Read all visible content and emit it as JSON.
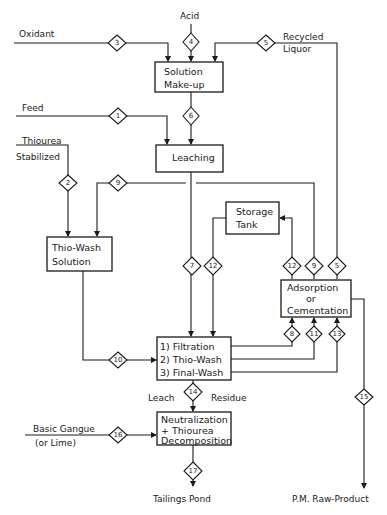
{
  "diagram": {
    "type": "process-flowsheet",
    "inputs": {
      "acid": "Acid",
      "oxidant": "Oxidant",
      "recycled_liquor_line1": "Recycled",
      "recycled_liquor_line2": "Liquor",
      "feed": "Feed",
      "thiourea_line1": "Thiourea",
      "thiourea_line2": "Stabilized",
      "basic_gangue_line1": "Basic Gangue",
      "basic_gangue_line2": "(or Lime)"
    },
    "units": {
      "solution_makeup": [
        "Solution",
        "Make-up"
      ],
      "leaching": [
        "Leaching"
      ],
      "thio_wash_solution": [
        "Thio-Wash",
        "Solution"
      ],
      "storage_tank": [
        "Storage",
        "Tank"
      ],
      "adsorption": [
        "Adsorption",
        "or",
        "Cementation"
      ],
      "filtration": [
        "1) Filtration",
        "2) Thio-Wash",
        "3) Final-Wash"
      ],
      "neutralization": [
        "Neutralization",
        "+ Thiourea",
        "Decomposition"
      ]
    },
    "labels": {
      "leach": "Leach",
      "residue": "Residue",
      "tailings_pond": "Tailings Pond",
      "pm_raw_product": "P.M. Raw-Product"
    },
    "streams": {
      "s1": "1",
      "s2": "2",
      "s3": "3",
      "s4": "4",
      "s5a": "5",
      "s5b": "5",
      "s6": "6",
      "s7": "7",
      "s8": "8",
      "s9a": "9",
      "s9b": "9",
      "s10": "10",
      "s11": "11",
      "s12a": "12",
      "s12b": "12",
      "s13": "13",
      "s14": "14",
      "s15": "15",
      "s16": "16",
      "s17": "17"
    }
  }
}
